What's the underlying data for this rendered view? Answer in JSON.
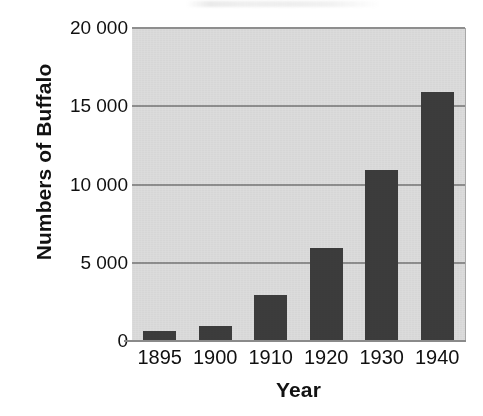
{
  "figure": {
    "background_color": "#ffffff",
    "plot_background_color": "#dcdcdc",
    "bar_color": "#3c3c3c",
    "gridline_color": "#8e8e8e",
    "axis_color": "#8a8a8a",
    "text_color": "#101010",
    "title_artifact": ""
  },
  "chart_data": {
    "type": "bar",
    "title": "",
    "xlabel": "Year",
    "ylabel": "Numbers of Buffalo",
    "categories": [
      "1895",
      "1900",
      "1910",
      "1920",
      "1930",
      "1940"
    ],
    "values": [
      700,
      1000,
      3000,
      6000,
      11000,
      16000
    ],
    "series": [
      {
        "name": "Numbers of Buffalo",
        "values": [
          700,
          1000,
          3000,
          6000,
          11000,
          16000
        ]
      }
    ],
    "ylim": [
      0,
      20000
    ],
    "yticks": [
      0,
      5000,
      10000,
      15000,
      20000
    ],
    "ytick_labels": [
      "0",
      "5 000",
      "10 000",
      "15 000",
      "20 000"
    ],
    "xtick_labels": [
      "1895",
      "1900",
      "1910",
      "1920",
      "1930",
      "1940"
    ],
    "grid": true,
    "grid_axis": "y",
    "legend": false,
    "legend_position": "none",
    "thousands_separator": " ",
    "annotations": []
  }
}
